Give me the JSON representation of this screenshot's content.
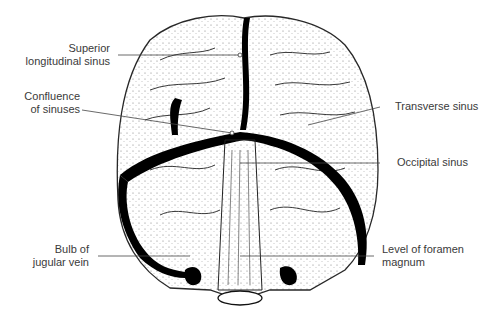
{
  "diagram": {
    "type": "anatomical-illustration",
    "labels": [
      {
        "id": "superior-longitudinal-sinus",
        "lines": [
          "Superior",
          "longitudinal sinus"
        ],
        "side": "left"
      },
      {
        "id": "confluence-of-sinuses",
        "lines": [
          "Confluence",
          "of sinuses"
        ],
        "side": "left"
      },
      {
        "id": "transverse-sinus",
        "lines": [
          "Transverse sinus"
        ],
        "side": "right"
      },
      {
        "id": "occipital-sinus",
        "lines": [
          "Occipital sinus"
        ],
        "side": "right"
      },
      {
        "id": "bulb-of-jugular-vein",
        "lines": [
          "Bulb of",
          "jugular vein"
        ],
        "side": "left"
      },
      {
        "id": "level-of-foramen-magnum",
        "lines": [
          "Level of foramen",
          "magnum"
        ],
        "side": "right"
      }
    ]
  }
}
